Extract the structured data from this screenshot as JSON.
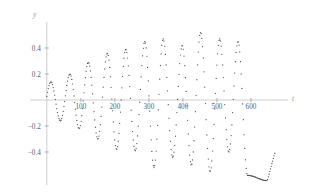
{
  "chart_data": {
    "type": "scatter",
    "title": "",
    "subtitle": "",
    "xlabel": "t",
    "ylabel": "y",
    "grid": false,
    "legend": null,
    "marker": "dot",
    "line_style": "dotted",
    "xlim": [
      -20,
      700
    ],
    "ylim": [
      -0.68,
      0.62
    ],
    "xticks": [
      100,
      200,
      300,
      400,
      500,
      600
    ],
    "xtick_labels": [
      "100",
      "200",
      "300",
      "400",
      "500",
      "600"
    ],
    "yticks": [
      -0.4,
      -0.2,
      0.2,
      0.4
    ],
    "ytick_labels": [
      "-0.4",
      "-0.2",
      "0.2",
      "0.4"
    ],
    "series": [
      {
        "name": "y(t)",
        "period": 55,
        "envelope_description": "amplitude grows from about 0.14 near t=0 to about 0.58 near t=660",
        "peaks": [
          {
            "t": 12,
            "y": 0.14
          },
          {
            "t": 68,
            "y": 0.2
          },
          {
            "t": 122,
            "y": 0.29
          },
          {
            "t": 178,
            "y": 0.36
          },
          {
            "t": 232,
            "y": 0.39
          },
          {
            "t": 288,
            "y": 0.45
          },
          {
            "t": 342,
            "y": 0.47
          },
          {
            "t": 398,
            "y": 0.42
          },
          {
            "t": 452,
            "y": 0.52
          },
          {
            "t": 508,
            "y": 0.47
          },
          {
            "t": 562,
            "y": 0.45
          }
        ],
        "troughs": [
          {
            "t": 40,
            "y": -0.16
          },
          {
            "t": 95,
            "y": -0.22
          },
          {
            "t": 150,
            "y": -0.3
          },
          {
            "t": 205,
            "y": -0.38
          },
          {
            "t": 260,
            "y": -0.39
          },
          {
            "t": 315,
            "y": -0.52
          },
          {
            "t": 370,
            "y": -0.44
          },
          {
            "t": 425,
            "y": -0.5
          },
          {
            "t": 480,
            "y": -0.55
          },
          {
            "t": 535,
            "y": -0.4
          },
          {
            "t": 590,
            "y": -0.58
          },
          {
            "t": 648,
            "y": -0.62
          }
        ]
      }
    ]
  },
  "axes": {
    "y_axis_name": "y",
    "x_axis_name": "t"
  }
}
